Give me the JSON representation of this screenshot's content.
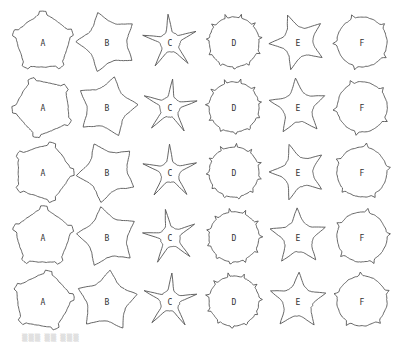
{
  "figure": {
    "columns": [
      "A",
      "B",
      "C",
      "D",
      "E",
      "F"
    ],
    "rows": 5,
    "column_centers_x": [
      43,
      107,
      170,
      234,
      298,
      362
    ],
    "row_centers_y": [
      42,
      107,
      172,
      237,
      301
    ],
    "stroke_color": "#555555",
    "background": "#ffffff",
    "shape_types": {
      "A": "rounded pentagon with small notched corners",
      "B": "pentagon with concave sides",
      "C": "five-armed star",
      "D": "round blob with many small spikes",
      "E": "fat five-armed star",
      "F": "round blob with few small spikes"
    }
  },
  "caption": "▒▒▒ ▒▒ ▒▒▒"
}
